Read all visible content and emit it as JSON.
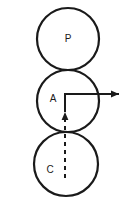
{
  "figure": {
    "background_color": "#ffffff",
    "stroke_color": "#1a1a1a",
    "width": 124,
    "height": 211
  },
  "circles": [
    {
      "id": "circle-p",
      "label": "P",
      "center_x": 68,
      "center_y": 39,
      "radius": 31,
      "label_x": 68,
      "label_y": 39,
      "stroke_width": 2.2
    },
    {
      "id": "circle-a",
      "label": "A",
      "center_x": 68,
      "center_y": 101,
      "radius": 31,
      "label_x": 53,
      "label_y": 99,
      "stroke_width": 2.2
    },
    {
      "id": "circle-c",
      "label": "C",
      "center_x": 66,
      "center_y": 164,
      "radius": 32,
      "label_x": 50,
      "label_y": 170,
      "stroke_width": 2.2
    }
  ],
  "arrows": {
    "corner_x": 65,
    "corner_y": 94,
    "horizontal": {
      "name": "horizontal-arrow",
      "from_x": 65,
      "to_x": 119,
      "y": 94,
      "stroke_width": 2,
      "head_points": "119,94 111,90.5 111,97.5"
    },
    "vertical": {
      "name": "vertical-arrow",
      "x": 65,
      "from_y": 94,
      "to_y": 112,
      "stroke_width": 2,
      "head_points": "65,112 61.6,120 68.4,120"
    }
  },
  "dashed_line": {
    "name": "dashed-center-line",
    "x": 65,
    "from_y": 118,
    "to_y": 179,
    "stroke_width": 2,
    "dash_pattern": "4 4"
  }
}
